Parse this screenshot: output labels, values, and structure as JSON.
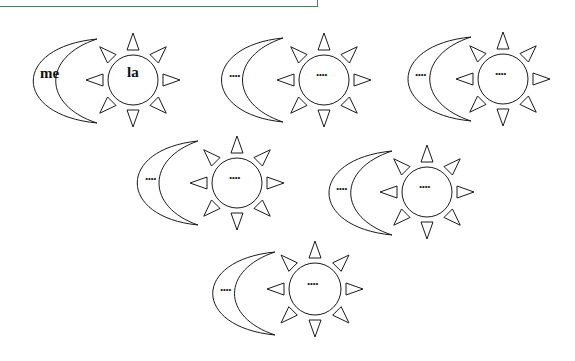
{
  "frame": {
    "border_color": "#3c8a5a"
  },
  "groups": [
    {
      "id": 1,
      "moon_label": "me",
      "sun_label": "la",
      "moon": {
        "left": 22,
        "tip_x": 97,
        "top": 39,
        "bottom": 123,
        "inner_left": 60
      },
      "sun": {
        "cx": 133,
        "cy": 80,
        "r": 25
      }
    },
    {
      "id": 2,
      "moon_label": "....",
      "sun_label": "....",
      "moon": {
        "left": 211,
        "tip_x": 283,
        "top": 38,
        "bottom": 122,
        "inner_left": 247
      },
      "sun": {
        "cx": 324,
        "cy": 80,
        "r": 25
      }
    },
    {
      "id": 3,
      "moon_label": "....",
      "sun_label": "....",
      "moon": {
        "left": 397,
        "tip_x": 471,
        "top": 37,
        "bottom": 121,
        "inner_left": 434
      },
      "sun": {
        "cx": 503,
        "cy": 79,
        "r": 25
      }
    },
    {
      "id": 4,
      "moon_label": "....",
      "sun_label": "....",
      "moon": {
        "left": 127,
        "tip_x": 198,
        "top": 141,
        "bottom": 225,
        "inner_left": 164
      },
      "sun": {
        "cx": 237,
        "cy": 183,
        "r": 25
      }
    },
    {
      "id": 5,
      "moon_label": "....",
      "sun_label": "....",
      "moon": {
        "left": 318,
        "tip_x": 392,
        "top": 151,
        "bottom": 235,
        "inner_left": 355
      },
      "sun": {
        "cx": 427,
        "cy": 192,
        "r": 25
      }
    },
    {
      "id": 6,
      "moon_label": "....",
      "sun_label": "....",
      "moon": {
        "left": 202,
        "tip_x": 275,
        "top": 252,
        "bottom": 335,
        "inner_left": 239
      },
      "sun": {
        "cx": 315,
        "cy": 289,
        "r": 26
      }
    }
  ]
}
